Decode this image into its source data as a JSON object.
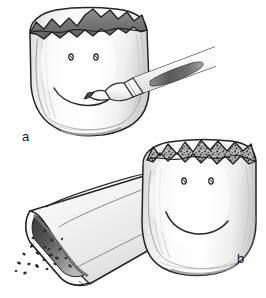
{
  "figure": {
    "style": "pen-and-ink with gray wash",
    "width_px": 266,
    "height_px": 298,
    "background_color": "#ffffff",
    "ink_color": "#262626",
    "wash_light": "#f2f2f2",
    "wash_mid": "#d9d9d9",
    "wash_dark": "#8c8c8c",
    "wash_darkest": "#4d4d4d"
  },
  "panels": [
    {
      "id": "a",
      "label": "a",
      "description": "Shell-like specimen with jagged dark broken upper rim, a hand-drawn smiley face on its front surface, and a marker pen touching the mouth line",
      "objects": [
        {
          "name": "specimen-shell",
          "description": "Rounded dome-shaped shell, light gray wash with vertical shading striations",
          "fill": "#f2f2f2"
        },
        {
          "name": "broken-rim",
          "description": "Jagged saw-tooth broken upper edge rendered as a solid dark gray band",
          "fill": "#7d7d7d"
        },
        {
          "name": "smiley-face",
          "description": "Two small oval eyes and a wide upward-curving mouth arc drawn in ink",
          "eye_count": 2
        },
        {
          "name": "marker-pen",
          "description": "Tapered marker pen angled from upper right, conical tip contacting the mouth line, barrel with a dark elongated ink-window",
          "tip_contact": true
        }
      ]
    },
    {
      "id": "b",
      "label": "b",
      "description": "Same specimen, now with a speckled granular upper rim, placed beside an open-ended tube with a dark interior; abrasive particles spill from the tube opening",
      "objects": [
        {
          "name": "specimen-shell",
          "description": "Rounded dome-shaped shell, light gray wash with vertical shading striations",
          "fill": "#f2f2f2"
        },
        {
          "name": "granular-rim",
          "description": "Jagged upper edge filled with dense stippled granular texture",
          "fill": "#9a9a9a"
        },
        {
          "name": "smiley-face",
          "description": "Two small oval eyes and a wide upward-curving mouth arc drawn in ink",
          "eye_count": 2
        },
        {
          "name": "abrasive-tube",
          "description": "Cylindrical tube angled from lower left, cut open at the near end revealing a dark shaded bore",
          "fill": "#f0f0f0",
          "bore_fill": "#4a4a4a"
        },
        {
          "name": "spilled-particles",
          "description": "Scattered small dark irregular granules falling from the tube opening",
          "count": 14
        }
      ]
    }
  ]
}
